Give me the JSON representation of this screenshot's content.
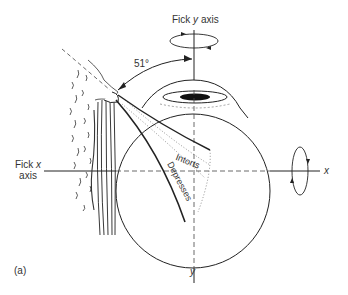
{
  "figure": {
    "panel_label": "(a)",
    "labels": {
      "fick_y_axis": "Fick y axis",
      "fick_y_prefix": "Fick ",
      "fick_y_var": "y",
      "fick_y_suffix": " axis",
      "fick_x_line1_prefix": "Fick ",
      "fick_x_var": "x",
      "fick_x_line2": "axis",
      "angle": "51°",
      "x_axis_end": "x",
      "y_axis_end": "y",
      "action_1": "Intorts",
      "action_2": "Depresses"
    },
    "colors": {
      "line": "#222222",
      "dashed": "#444444",
      "background": "#ffffff"
    }
  }
}
